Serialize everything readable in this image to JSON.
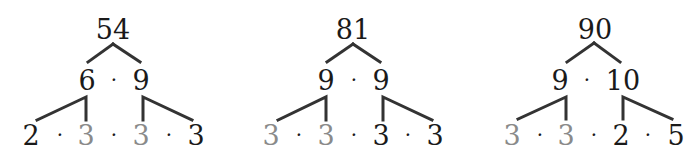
{
  "colors": {
    "dark": "#1a1a1a",
    "gray": "#8a8a8a",
    "line": "#333333"
  },
  "trees": [
    {
      "root": "54",
      "level2": [
        "6",
        "9"
      ],
      "leaves": [
        {
          "value": "2",
          "style": "dark"
        },
        {
          "value": "3",
          "style": "gray"
        },
        {
          "value": "3",
          "style": "gray"
        },
        {
          "value": "3",
          "style": "dark"
        }
      ]
    },
    {
      "root": "81",
      "level2": [
        "9",
        "9"
      ],
      "leaves": [
        {
          "value": "3",
          "style": "gray"
        },
        {
          "value": "3",
          "style": "gray"
        },
        {
          "value": "3",
          "style": "dark"
        },
        {
          "value": "3",
          "style": "dark"
        }
      ]
    },
    {
      "root": "90",
      "level2": [
        "9",
        "10"
      ],
      "leaves": [
        {
          "value": "3",
          "style": "gray"
        },
        {
          "value": "3",
          "style": "gray"
        },
        {
          "value": "2",
          "style": "dark"
        },
        {
          "value": "5",
          "style": "dark"
        }
      ]
    }
  ],
  "operator": "·"
}
